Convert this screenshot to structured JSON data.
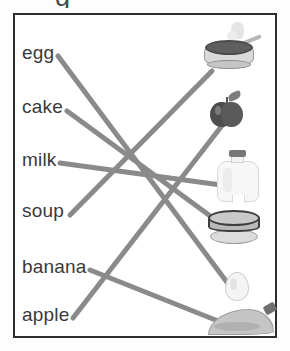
{
  "worksheet": {
    "type": "matching-exercise",
    "cropped_text_above_frame": "g",
    "frame_border_color": "#2e2e2e",
    "line_color": "#8a8a8a",
    "line_width": 5,
    "words": [
      {
        "id": "egg",
        "label": "egg",
        "x": 22,
        "y": 56
      },
      {
        "id": "cake",
        "label": "cake",
        "x": 22,
        "y": 110
      },
      {
        "id": "milk",
        "label": "milk",
        "x": 22,
        "y": 163
      },
      {
        "id": "soup",
        "label": "soup",
        "x": 22,
        "y": 214
      },
      {
        "id": "banana",
        "label": "banana",
        "x": 22,
        "y": 270
      },
      {
        "id": "apple",
        "label": "apple",
        "x": 22,
        "y": 318
      }
    ],
    "pictures": [
      {
        "id": "soup-bowl",
        "name": "soup-bowl-image",
        "x": 203,
        "y": 22,
        "w": 55,
        "h": 50
      },
      {
        "id": "apple-pic",
        "name": "apple-image",
        "x": 210,
        "y": 92,
        "w": 35,
        "h": 38
      },
      {
        "id": "milk-jug",
        "name": "milk-jug-image",
        "x": 215,
        "y": 150,
        "w": 48,
        "h": 56
      },
      {
        "id": "cake-pic",
        "name": "cake-image",
        "x": 207,
        "y": 210,
        "w": 56,
        "h": 38
      },
      {
        "id": "egg-pic",
        "name": "egg-image",
        "x": 225,
        "y": 272,
        "w": 26,
        "h": 31
      },
      {
        "id": "banana-pic",
        "name": "banana-image",
        "x": 208,
        "y": 303,
        "w": 70,
        "h": 35
      }
    ],
    "connections": [
      {
        "from": "egg",
        "to": "egg-pic",
        "x1": 58,
        "y1": 56,
        "x2": 232,
        "y2": 289
      },
      {
        "from": "cake",
        "to": "cake-pic",
        "x1": 67,
        "y1": 111,
        "x2": 228,
        "y2": 229
      },
      {
        "from": "milk",
        "to": "milk-jug",
        "x1": 60,
        "y1": 163,
        "x2": 221,
        "y2": 185
      },
      {
        "from": "soup",
        "to": "soup-bowl",
        "x1": 70,
        "y1": 215,
        "x2": 212,
        "y2": 71
      },
      {
        "from": "banana",
        "to": "banana-pic",
        "x1": 90,
        "y1": 270,
        "x2": 223,
        "y2": 323
      },
      {
        "from": "apple",
        "to": "apple-pic",
        "x1": 73,
        "y1": 318,
        "x2": 224,
        "y2": 123
      }
    ]
  }
}
